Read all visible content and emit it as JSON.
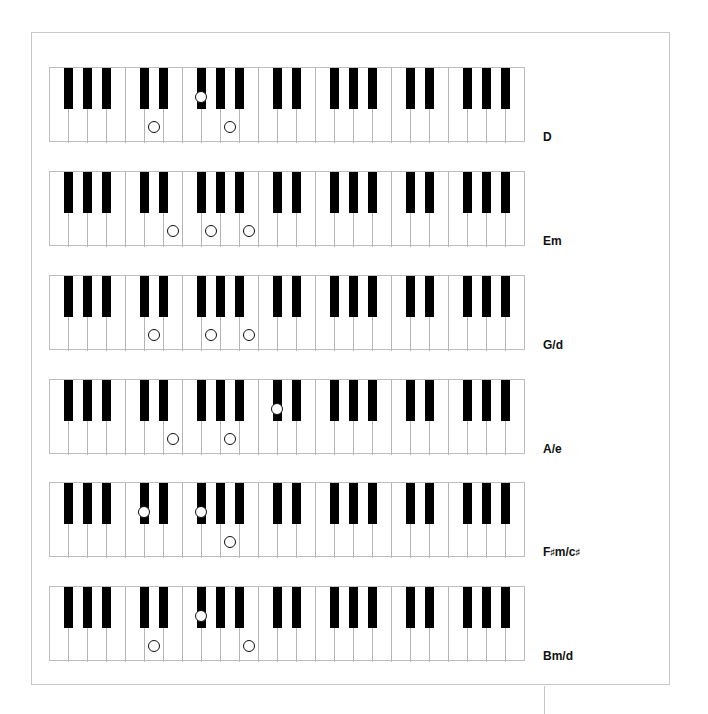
{
  "keyboard": {
    "first_white_key": "F",
    "white_key_count": 25,
    "white_key_names": [
      "F",
      "G",
      "A",
      "B",
      "C",
      "D",
      "E",
      "F",
      "G",
      "A",
      "B",
      "C",
      "D",
      "E",
      "F",
      "G",
      "A",
      "B",
      "C",
      "D",
      "E",
      "F",
      "G",
      "A",
      "B"
    ],
    "black_key_after_white_index": [
      0,
      1,
      2,
      4,
      5,
      7,
      8,
      9,
      11,
      12,
      14,
      15,
      16,
      18,
      19,
      21,
      22,
      23
    ]
  },
  "colors": {
    "frame": "#c8c8c8",
    "key_outline": "#b5b5b5",
    "black_key": "#000000",
    "dot_outline": "#111111"
  },
  "chords": [
    {
      "label": "D",
      "notes": [
        "D",
        "F#",
        "A"
      ],
      "white_dots": [
        5,
        9
      ],
      "black_dots": [
        7
      ]
    },
    {
      "label": "Em",
      "notes": [
        "E",
        "G",
        "B"
      ],
      "white_dots": [
        6,
        8,
        10
      ],
      "black_dots": []
    },
    {
      "label": "G/d",
      "notes": [
        "D",
        "G",
        "B"
      ],
      "white_dots": [
        5,
        8,
        10
      ],
      "black_dots": []
    },
    {
      "label": "A/e",
      "notes": [
        "E",
        "A",
        "C#"
      ],
      "white_dots": [
        6,
        9
      ],
      "black_dots": [
        11
      ]
    },
    {
      "label": "F♯m/c♯",
      "notes": [
        "C#",
        "F#",
        "A"
      ],
      "white_dots": [
        9
      ],
      "black_dots": [
        4,
        7
      ]
    },
    {
      "label": "Bm/d",
      "notes": [
        "D",
        "F#",
        "B"
      ],
      "white_dots": [
        5,
        10
      ],
      "black_dots": [
        7
      ]
    }
  ]
}
